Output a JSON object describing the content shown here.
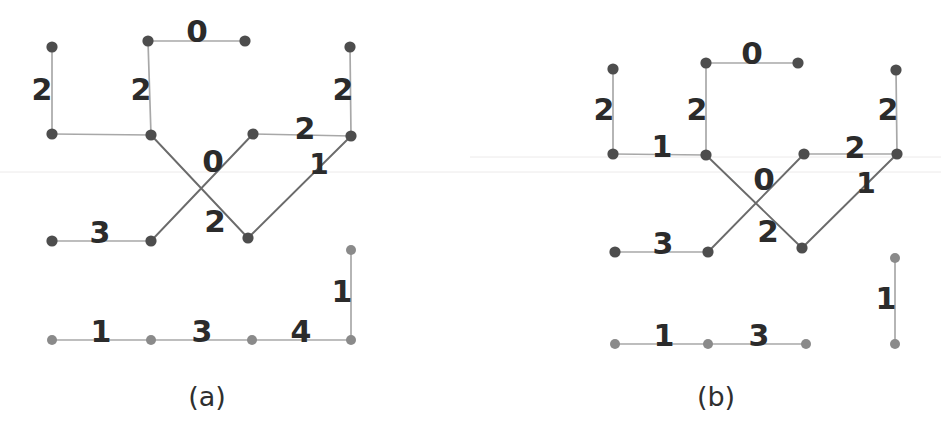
{
  "figure": {
    "background_color": "#ffffff",
    "width": 941,
    "height": 439,
    "node_color_dark": "#4d4d4d",
    "node_color_light": "#8a8a8a",
    "edge_color_dark": "#6b6b6b",
    "edge_color_light": "#a8a8a8",
    "label_color": "#2b2b2b"
  },
  "panels": [
    {
      "id": "panel-a",
      "caption": "(a)",
      "caption_x": 207,
      "caption_y": 398,
      "nodes": [
        {
          "id": "a-n1",
          "x": 52,
          "y": 47,
          "shade": "dark"
        },
        {
          "id": "a-n2",
          "x": 148,
          "y": 41,
          "shade": "dark"
        },
        {
          "id": "a-n3",
          "x": 245,
          "y": 41,
          "shade": "dark"
        },
        {
          "id": "a-n4",
          "x": 350,
          "y": 47,
          "shade": "dark"
        },
        {
          "id": "a-n5",
          "x": 52,
          "y": 134,
          "shade": "dark"
        },
        {
          "id": "a-n6",
          "x": 151,
          "y": 135,
          "shade": "dark"
        },
        {
          "id": "a-n7",
          "x": 253,
          "y": 134,
          "shade": "dark"
        },
        {
          "id": "a-n8",
          "x": 351,
          "y": 136,
          "shade": "dark"
        },
        {
          "id": "a-n9",
          "x": 52,
          "y": 241,
          "shade": "dark"
        },
        {
          "id": "a-n10",
          "x": 151,
          "y": 241,
          "shade": "dark"
        },
        {
          "id": "a-n11",
          "x": 248,
          "y": 238,
          "shade": "dark"
        },
        {
          "id": "a-n12",
          "x": 351,
          "y": 250,
          "shade": "light"
        },
        {
          "id": "a-n13",
          "x": 52,
          "y": 340,
          "shade": "light"
        },
        {
          "id": "a-n14",
          "x": 151,
          "y": 340,
          "shade": "light"
        },
        {
          "id": "a-n15",
          "x": 252,
          "y": 340,
          "shade": "light"
        },
        {
          "id": "a-n16",
          "x": 351,
          "y": 340,
          "shade": "light"
        }
      ],
      "edges": [
        {
          "from": "a-n1",
          "to": "a-n5",
          "weight": "2",
          "lx": 42,
          "ly": 91,
          "fs": 30,
          "shade": "light"
        },
        {
          "from": "a-n2",
          "to": "a-n3",
          "weight": "0",
          "lx": 197,
          "ly": 33,
          "fs": 31,
          "shade": "light"
        },
        {
          "from": "a-n2",
          "to": "a-n6",
          "weight": "2",
          "lx": 141,
          "ly": 91,
          "fs": 30,
          "shade": "light"
        },
        {
          "from": "a-n4",
          "to": "a-n8",
          "weight": "2",
          "lx": 343,
          "ly": 91,
          "fs": 30,
          "shade": "light"
        },
        {
          "from": "a-n5",
          "to": "a-n6",
          "weight": "",
          "lx": 0,
          "ly": 0,
          "fs": 0,
          "shade": "light"
        },
        {
          "from": "a-n6",
          "to": "a-n11",
          "weight": "2",
          "lx": 215,
          "ly": 223,
          "fs": 31,
          "shade": "dark"
        },
        {
          "from": "a-n7",
          "to": "a-n10",
          "weight": "0",
          "lx": 213,
          "ly": 163,
          "fs": 31,
          "shade": "dark"
        },
        {
          "from": "a-n7",
          "to": "a-n8",
          "weight": "2",
          "lx": 305,
          "ly": 130,
          "fs": 30,
          "shade": "light"
        },
        {
          "from": "a-n8",
          "to": "a-n11",
          "weight": "1",
          "lx": 319,
          "ly": 166,
          "fs": 28,
          "shade": "dark"
        },
        {
          "from": "a-n9",
          "to": "a-n10",
          "weight": "3",
          "lx": 100,
          "ly": 234,
          "fs": 30,
          "shade": "light"
        },
        {
          "from": "a-n12",
          "to": "a-n16",
          "weight": "1",
          "lx": 342,
          "ly": 293,
          "fs": 30,
          "shade": "light"
        },
        {
          "from": "a-n13",
          "to": "a-n14",
          "weight": "1",
          "lx": 101,
          "ly": 333,
          "fs": 30,
          "shade": "light"
        },
        {
          "from": "a-n14",
          "to": "a-n15",
          "weight": "3",
          "lx": 202,
          "ly": 333,
          "fs": 30,
          "shade": "light"
        },
        {
          "from": "a-n15",
          "to": "a-n16",
          "weight": "4",
          "lx": 301,
          "ly": 333,
          "fs": 30,
          "shade": "light"
        }
      ]
    },
    {
      "id": "panel-b",
      "caption": "(b)",
      "caption_x": 716,
      "caption_y": 398,
      "nodes": [
        {
          "id": "b-n1",
          "x": 613,
          "y": 69,
          "shade": "dark"
        },
        {
          "id": "b-n2",
          "x": 706,
          "y": 63,
          "shade": "dark"
        },
        {
          "id": "b-n3",
          "x": 798,
          "y": 63,
          "shade": "dark"
        },
        {
          "id": "b-n4",
          "x": 896,
          "y": 70,
          "shade": "dark"
        },
        {
          "id": "b-n5",
          "x": 613,
          "y": 154,
          "shade": "dark"
        },
        {
          "id": "b-n6",
          "x": 706,
          "y": 155,
          "shade": "dark"
        },
        {
          "id": "b-n7",
          "x": 804,
          "y": 154,
          "shade": "dark"
        },
        {
          "id": "b-n8",
          "x": 897,
          "y": 154,
          "shade": "dark"
        },
        {
          "id": "b-n9",
          "x": 615,
          "y": 252,
          "shade": "dark"
        },
        {
          "id": "b-n10",
          "x": 708,
          "y": 252,
          "shade": "dark"
        },
        {
          "id": "b-n11",
          "x": 802,
          "y": 248,
          "shade": "dark"
        },
        {
          "id": "b-n12",
          "x": 895,
          "y": 258,
          "shade": "light"
        },
        {
          "id": "b-n13",
          "x": 615,
          "y": 344,
          "shade": "light"
        },
        {
          "id": "b-n14",
          "x": 708,
          "y": 344,
          "shade": "light"
        },
        {
          "id": "b-n15",
          "x": 806,
          "y": 344,
          "shade": "light"
        },
        {
          "id": "b-n16",
          "x": 895,
          "y": 344,
          "shade": "light"
        }
      ],
      "edges": [
        {
          "from": "b-n1",
          "to": "b-n5",
          "weight": "2",
          "lx": 604,
          "ly": 111,
          "fs": 30,
          "shade": "light"
        },
        {
          "from": "b-n2",
          "to": "b-n3",
          "weight": "0",
          "lx": 752,
          "ly": 55,
          "fs": 31,
          "shade": "light"
        },
        {
          "from": "b-n2",
          "to": "b-n6",
          "weight": "2",
          "lx": 697,
          "ly": 111,
          "fs": 30,
          "shade": "light"
        },
        {
          "from": "b-n4",
          "to": "b-n8",
          "weight": "2",
          "lx": 888,
          "ly": 111,
          "fs": 30,
          "shade": "light"
        },
        {
          "from": "b-n5",
          "to": "b-n6",
          "weight": "1",
          "lx": 662,
          "ly": 148,
          "fs": 30,
          "shade": "light"
        },
        {
          "from": "b-n6",
          "to": "b-n11",
          "weight": "2",
          "lx": 768,
          "ly": 233,
          "fs": 31,
          "shade": "dark"
        },
        {
          "from": "b-n7",
          "to": "b-n10",
          "weight": "0",
          "lx": 764,
          "ly": 181,
          "fs": 31,
          "shade": "dark"
        },
        {
          "from": "b-n7",
          "to": "b-n8",
          "weight": "2",
          "lx": 855,
          "ly": 149,
          "fs": 30,
          "shade": "light"
        },
        {
          "from": "b-n8",
          "to": "b-n11",
          "weight": "1",
          "lx": 866,
          "ly": 185,
          "fs": 28,
          "shade": "dark"
        },
        {
          "from": "b-n9",
          "to": "b-n10",
          "weight": "3",
          "lx": 663,
          "ly": 245,
          "fs": 30,
          "shade": "light"
        },
        {
          "from": "b-n12",
          "to": "b-n16",
          "weight": "1",
          "lx": 886,
          "ly": 300,
          "fs": 30,
          "shade": "light"
        },
        {
          "from": "b-n13",
          "to": "b-n14",
          "weight": "1",
          "lx": 664,
          "ly": 337,
          "fs": 30,
          "shade": "light"
        },
        {
          "from": "b-n14",
          "to": "b-n15",
          "weight": "3",
          "lx": 759,
          "ly": 337,
          "fs": 30,
          "shade": "light"
        }
      ]
    }
  ]
}
